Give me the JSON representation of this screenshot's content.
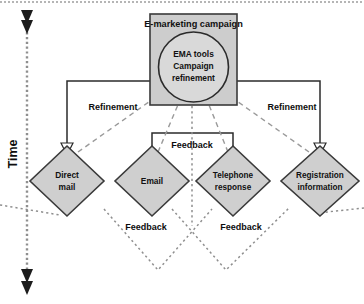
{
  "figure": {
    "type": "flow-diagram",
    "title_of_process": "E-marketing campaign",
    "axis": {
      "label": "Time",
      "orientation": "vertical",
      "direction": "downward",
      "style": "dotted line with double arrowheads"
    },
    "central_node": {
      "name": "campaign-box",
      "shape": "rectangle",
      "header": "E-marketing campaign",
      "inner_shape": "circle",
      "inner_lines": [
        "EMA tools",
        "Campaign",
        "refinement"
      ],
      "fill": "#cdcdcd",
      "inner_fill": "#d9d9d9",
      "stroke": "#3a3a3a"
    },
    "channels": [
      {
        "id": "direct-mail",
        "lines": [
          "Direct",
          "mail"
        ],
        "shape": "diamond",
        "fill": "#cfcfcf"
      },
      {
        "id": "email",
        "lines": [
          "Email"
        ],
        "shape": "diamond",
        "fill": "#cfcfcf"
      },
      {
        "id": "telephone-response",
        "lines": [
          "Telephone",
          "response"
        ],
        "shape": "diamond",
        "fill": "#cfcfcf"
      },
      {
        "id": "registration-information",
        "lines": [
          "Registration",
          "information"
        ],
        "shape": "diamond",
        "fill": "#cfcfcf"
      }
    ],
    "connector_labels": [
      {
        "id": "refinement-left",
        "text": "Refinement"
      },
      {
        "id": "refinement-right",
        "text": "Refinement"
      },
      {
        "id": "feedback-top-center",
        "text": "Feedback"
      },
      {
        "id": "feedback-bottom-left",
        "text": "Feedback"
      },
      {
        "id": "feedback-bottom-right",
        "text": "Feedback"
      }
    ],
    "colors": {
      "node_fill": "#cfcfcf",
      "node_stroke": "#3a3a3a",
      "solid_line": "#2b2b2b",
      "dashed_line": "#9a9a9a",
      "dotted_line": "#8f8f8f",
      "text": "#111111",
      "background": "#ffffff"
    }
  }
}
